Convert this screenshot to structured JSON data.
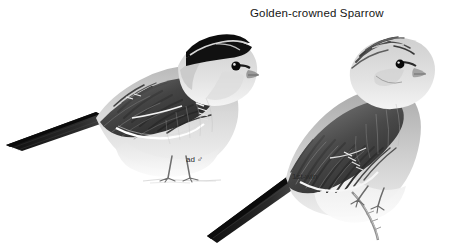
{
  "plate": {
    "title": "Golden-crowned Sparrow",
    "background_color": "#ffffff",
    "ink_color": "#1a1a1a",
    "medium": "grayscale field-guide illustration"
  },
  "labels": {
    "adult_male": "ad ♂",
    "first_winter": "1st-win"
  },
  "figures": [
    {
      "id": "adult-male",
      "label": "ad ♂",
      "pose": "perched on ground, body in left profile, head turned toward viewer",
      "orientation": "facing right, long tail to the left",
      "plumage_notes": "black lateral crown stripes enclosing pale median crown stripe, gray face and nape, dark-streaked brown mantle, two white wing bars, plain pale gray underparts, long blackish tail",
      "bounding_box": {
        "x": 4,
        "y": 26,
        "width": 226,
        "height": 160
      }
    },
    {
      "id": "first-winter",
      "label": "1st-win",
      "pose": "perched clinging to a thin upright twig, body angled, head in profile",
      "orientation": "facing right, long tail down to the lower left",
      "plumage_notes": "dull brown crown with faint dusky lateral stripes and dull buff median stripe, brown-streaked mantle, narrow buff wing bars, buff-gray underparts, long dark tail",
      "bounding_box": {
        "x": 205,
        "y": 33,
        "width": 216,
        "height": 205
      }
    }
  ]
}
